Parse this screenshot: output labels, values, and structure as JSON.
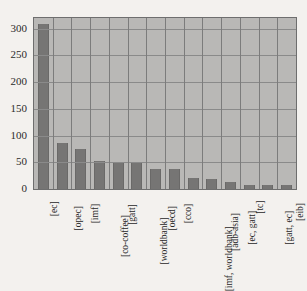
{
  "chart_data": {
    "type": "bar",
    "title": "",
    "subtitle": "",
    "xlabel": "",
    "ylabel": "",
    "ylim": [
      0,
      320
    ],
    "yticks": [
      0,
      50,
      100,
      150,
      200,
      250,
      300
    ],
    "ytick_labels": [
      "0",
      "50",
      "100",
      "150",
      "200",
      "250",
      "300"
    ],
    "grid": true,
    "grid_axes": "both",
    "legend": false,
    "legend_position": "none",
    "bar_color": "#767574",
    "plot_background": "#b9b8b6",
    "figure_background": "#f3f1ee",
    "grid_color": "#8a8a8a",
    "categories": [
      "[ec]",
      "[opec]",
      "[imf]",
      "[co-coffee]",
      "[gatt]",
      "[worldbank]",
      "[oecd]",
      "[cco]",
      "[imf, worldbank]",
      "[adb-asia]",
      "[ec, gatt]",
      "[tc]",
      "[gatt, ec]",
      "[eib]"
    ],
    "values": [
      308,
      87,
      74,
      53,
      51,
      49,
      37,
      37,
      20,
      19,
      13,
      8,
      7,
      7
    ]
  }
}
